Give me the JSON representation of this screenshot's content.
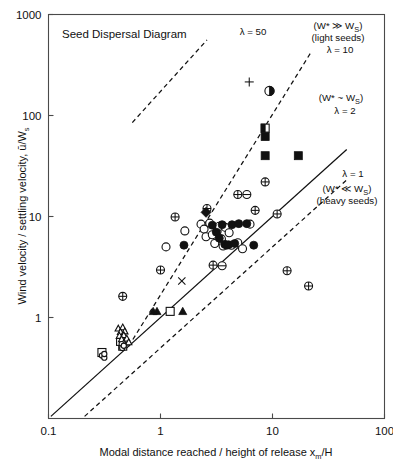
{
  "chart_data": {
    "type": "scatter",
    "title": "Seed Dispersal Diagram",
    "xlabel": "Modal distance reached / height of release x",
    "xlabel_sub": "m",
    "xlabel_tail": "/H",
    "ylabel": "Wind velocity / settling velocity, ū/W",
    "ylabel_sub": "s",
    "xscale": "log",
    "yscale": "log",
    "xlim": [
      0.1,
      100
    ],
    "ylim": [
      0.1,
      1000
    ],
    "xticks": [
      "0.1",
      "1",
      "10",
      "100"
    ],
    "yticks": [
      "1000",
      "100",
      "10",
      "1"
    ],
    "grid": false,
    "legend": "none",
    "annotations": [
      {
        "id": "lambda-50",
        "text": "λ = 50",
        "x": 2.2,
        "y": 600
      },
      {
        "id": "regime-light",
        "text": "(W* ≫ W",
        "sub": "S",
        "tail": ")",
        "x": 18,
        "y": 700
      },
      {
        "id": "light-seeds",
        "text": "(light seeds)",
        "x": 18,
        "y": 520
      },
      {
        "id": "lambda-10",
        "text": "λ = 10",
        "x": 22,
        "y": 390
      },
      {
        "id": "regime-similar",
        "text": "(W* ~ W",
        "sub": "S",
        "tail": ")",
        "x": 30,
        "y": 150
      },
      {
        "id": "lambda-2",
        "text": "λ = 2",
        "x": 34,
        "y": 110
      },
      {
        "id": "lambda-1",
        "text": "λ = 1",
        "x": 40,
        "y": 30
      },
      {
        "id": "regime-heavy",
        "text": "(W* ≪ W",
        "sub": "S",
        "tail": ")",
        "x": 38,
        "y": 22
      },
      {
        "id": "heavy-seeds",
        "text": "(heavy seeds)",
        "x": 38,
        "y": 16
      }
    ],
    "reference_lines": [
      {
        "id": "lambda-1-line",
        "label": "λ = 1",
        "style": "solid",
        "slope": 1,
        "x0": 0.105,
        "y0": 0.105,
        "x1": 46,
        "y1": 46
      },
      {
        "id": "lambda-2-line",
        "label": "λ = 2",
        "style": "dashed",
        "slope": 1,
        "x0": 0.21,
        "y0": 0.105,
        "x1": 46,
        "y1": 23
      },
      {
        "id": "lambda-10-line",
        "label": "λ = 10",
        "style": "dashed",
        "slope": 1,
        "x0": 0.52,
        "y0": 0.52,
        "x1": 22,
        "y1": 420
      },
      {
        "id": "lambda-50-line",
        "label": "λ = 50",
        "style": "dashed",
        "slope": 1,
        "x0": 0.56,
        "y0": 85,
        "x1": 2.6,
        "y1": 560
      }
    ],
    "series": [
      {
        "name": "open-circle",
        "marker": "open-circle",
        "points": [
          [
            1.12,
            5.0
          ],
          [
            1.65,
            7.2
          ],
          [
            2.3,
            8.4
          ],
          [
            2.45,
            7.5
          ],
          [
            2.55,
            6.3
          ],
          [
            2.75,
            8.6
          ],
          [
            2.9,
            6.6
          ],
          [
            3.05,
            5.4
          ],
          [
            3.2,
            7.1
          ],
          [
            3.35,
            8.0
          ],
          [
            3.5,
            6.0
          ],
          [
            3.62,
            5.1
          ],
          [
            3.8,
            7.8
          ],
          [
            4.1,
            6.9
          ],
          [
            4.3,
            5.2
          ],
          [
            4.9,
            5.5
          ],
          [
            5.4,
            4.8
          ],
          [
            6.3,
            8.4
          ]
        ]
      },
      {
        "name": "filled-circle",
        "marker": "filled-circle",
        "points": [
          [
            1.62,
            5.2
          ],
          [
            2.9,
            8.2
          ],
          [
            3.15,
            7.0
          ],
          [
            3.35,
            6.1
          ],
          [
            3.55,
            8.3
          ],
          [
            3.75,
            5.3
          ],
          [
            3.9,
            5.2
          ],
          [
            4.05,
            5.25
          ],
          [
            4.35,
            8.3
          ],
          [
            4.6,
            5.4
          ],
          [
            5.0,
            8.5
          ],
          [
            5.9,
            8.5
          ],
          [
            6.8,
            5.2
          ]
        ]
      },
      {
        "name": "crossed-circle",
        "marker": "crossed-circle",
        "points": [
          [
            0.46,
            1.62
          ],
          [
            1.0,
            2.95
          ],
          [
            1.35,
            9.9
          ],
          [
            2.6,
            12.0
          ],
          [
            2.95,
            3.3
          ],
          [
            4.9,
            16.5
          ],
          [
            7.0,
            11.5
          ],
          [
            8.6,
            22.0
          ],
          [
            11.0,
            10.6
          ],
          [
            13.5,
            2.9
          ],
          [
            21.0,
            2.05
          ]
        ]
      },
      {
        "name": "horizontal-circle",
        "marker": "h-circle",
        "points": [
          [
            3.55,
            3.25
          ],
          [
            5.9,
            16.5
          ]
        ]
      },
      {
        "name": "filled-square",
        "marker": "filled-square",
        "points": [
          [
            8.6,
            62.0
          ],
          [
            8.6,
            40.0
          ],
          [
            17.0,
            40.0
          ]
        ]
      },
      {
        "name": "half-square",
        "marker": "half-square",
        "points": [
          [
            8.6,
            75.0
          ]
        ]
      },
      {
        "name": "half-circle",
        "marker": "half-circle",
        "points": [
          [
            9.4,
            175.0
          ]
        ]
      },
      {
        "name": "plus",
        "marker": "plus",
        "points": [
          [
            6.2,
            215.0
          ]
        ]
      },
      {
        "name": "cross-x",
        "marker": "x",
        "points": [
          [
            1.55,
            2.3
          ]
        ]
      },
      {
        "name": "filled-diamond",
        "marker": "filled-diamond",
        "points": [
          [
            2.55,
            11.0
          ]
        ]
      },
      {
        "name": "filled-triangle",
        "marker": "filled-triangle",
        "points": [
          [
            0.86,
            1.15
          ],
          [
            0.93,
            1.15
          ],
          [
            1.58,
            1.15
          ]
        ]
      },
      {
        "name": "open-square",
        "marker": "open-square",
        "points": [
          [
            1.22,
            1.15
          ],
          [
            0.3,
            0.45
          ],
          [
            0.46,
            0.52
          ],
          [
            0.44,
            0.58
          ]
        ]
      },
      {
        "name": "open-triangle",
        "marker": "open-triangle",
        "points": [
          [
            0.42,
            0.78
          ],
          [
            0.46,
            0.8
          ],
          [
            0.44,
            0.72
          ],
          [
            0.48,
            0.73
          ],
          [
            0.43,
            0.66
          ],
          [
            0.47,
            0.67
          ],
          [
            0.45,
            0.61
          ],
          [
            0.5,
            0.62
          ],
          [
            0.47,
            0.56
          ],
          [
            0.52,
            0.57
          ]
        ]
      },
      {
        "name": "open-circle-small",
        "marker": "open-circle-sm",
        "points": [
          [
            0.3,
            0.42
          ],
          [
            0.315,
            0.4
          ],
          [
            0.45,
            0.545
          ],
          [
            0.455,
            0.5
          ],
          [
            0.47,
            0.525
          ],
          [
            0.315,
            0.435
          ]
        ]
      }
    ]
  },
  "figure": {
    "background": "#ffffff",
    "axis_color": "#4a4a4a",
    "marker_color": "#111111"
  }
}
